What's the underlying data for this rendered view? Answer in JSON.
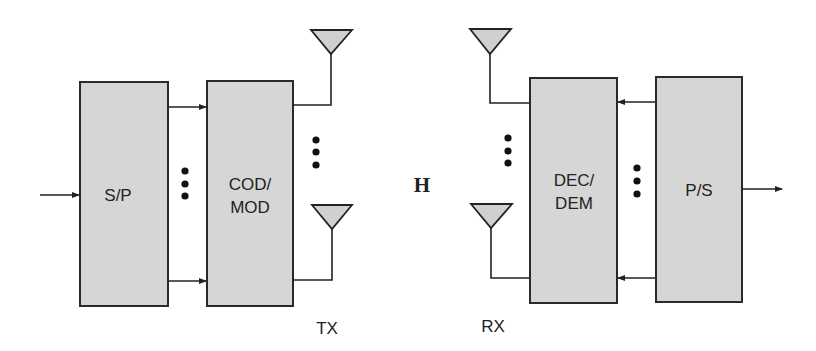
{
  "diagram": {
    "blocks": [
      {
        "id": "sp",
        "label_lines": [
          "S/P"
        ]
      },
      {
        "id": "codmod",
        "label_lines": [
          "COD/",
          "MOD"
        ]
      },
      {
        "id": "decdem",
        "label_lines": [
          "DEC/",
          "DEM"
        ]
      },
      {
        "id": "ps",
        "label_lines": [
          "P/S"
        ]
      }
    ],
    "channel_label": "H",
    "tx_label": "TX",
    "rx_label": "RX",
    "colors": {
      "block_fill": "#d6d6d6",
      "stroke": "#222222",
      "antenna_fill": "#d0d0d0"
    }
  }
}
